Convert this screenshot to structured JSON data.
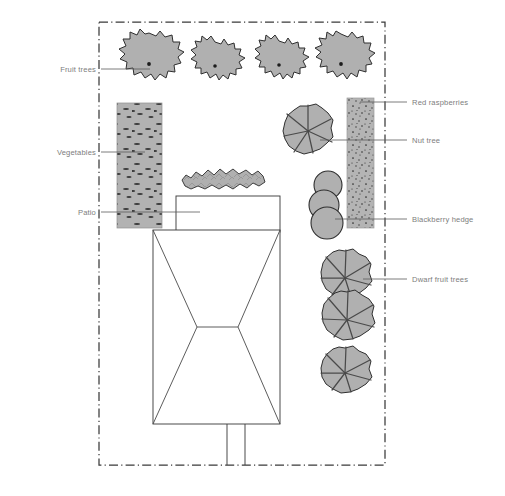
{
  "diagram": {
    "type": "garden-site-plan",
    "canvas": {
      "width": 505,
      "height": 496
    },
    "colors": {
      "background": "#ffffff",
      "boundary_line": "#3a3a3a",
      "plant_fill": "#b0b0b0",
      "plant_outline": "#2f2f2f",
      "bed_fill": "#b2b2b2",
      "structure_stroke": "#3f3f3f",
      "structure_fill": "#ffffff",
      "label_text": "#7d7d7d",
      "leader_line": "#5a5a5a"
    },
    "boundary": {
      "name": "property-boundary",
      "style": "dash-dot",
      "x": 99,
      "y": 22,
      "width": 286,
      "height": 443
    }
  },
  "labels": {
    "left": [
      {
        "id": "fruit-trees",
        "text": "Fruit trees",
        "text_x": 96,
        "text_y": 72,
        "leader_from_x": 101,
        "leader_to_x": 150,
        "leader_y": 69
      },
      {
        "id": "vegetables",
        "text": "Vegetables",
        "text_x": 96,
        "text_y": 155,
        "leader_from_x": 101,
        "leader_to_x": 145,
        "leader_y": 152
      },
      {
        "id": "patio",
        "text": "Patio",
        "text_x": 96,
        "text_y": 215,
        "leader_from_x": 101,
        "leader_to_x": 200,
        "leader_y": 212
      }
    ],
    "right": [
      {
        "id": "red-raspberries",
        "text": "Red raspberries",
        "text_x": 412,
        "text_y": 105,
        "leader_from_x": 360,
        "leader_to_x": 407,
        "leader_y": 102
      },
      {
        "id": "nut-tree",
        "text": "Nut tree",
        "text_x": 412,
        "text_y": 143,
        "leader_from_x": 320,
        "leader_to_x": 407,
        "leader_y": 140
      },
      {
        "id": "blackberry-hedge",
        "text": "Blackberry hedge",
        "text_x": 412,
        "text_y": 222,
        "leader_from_x": 335,
        "leader_to_x": 407,
        "leader_y": 219
      },
      {
        "id": "dwarf-fruit-trees",
        "text": "Dwarf fruit trees",
        "text_x": 412,
        "text_y": 282,
        "leader_from_x": 363,
        "leader_to_x": 407,
        "leader_y": 279
      }
    ]
  },
  "features": {
    "fruit_trees": {
      "name": "Fruit trees",
      "count": 4,
      "centers": [
        [
          149,
          64
        ],
        [
          215,
          66
        ],
        [
          279,
          65
        ],
        [
          341,
          64
        ]
      ],
      "radii": [
        31,
        26,
        26,
        28
      ]
    },
    "vegetable_bed": {
      "name": "Vegetables",
      "x": 117,
      "y": 103,
      "width": 45,
      "height": 125,
      "texture": "dashes"
    },
    "raspberry_strip": {
      "name": "Red raspberries",
      "x": 347,
      "y": 98,
      "width": 27,
      "height": 130,
      "texture": "stipple"
    },
    "nut_tree": {
      "name": "Nut tree",
      "center": [
        308,
        131
      ],
      "radius": 25,
      "lobes": 7
    },
    "blackberry_hedge": {
      "name": "Blackberry hedge",
      "circles": [
        {
          "cx": 328,
          "cy": 185,
          "r": 14
        },
        {
          "cx": 324,
          "cy": 205,
          "r": 15
        },
        {
          "cx": 327,
          "cy": 223,
          "r": 16
        }
      ]
    },
    "dwarf_fruit_trees": {
      "name": "Dwarf fruit trees",
      "count": 3,
      "centers": [
        [
          345,
          278
        ],
        [
          347,
          320
        ],
        [
          345,
          373
        ]
      ],
      "radii": [
        27,
        28,
        26
      ],
      "lobes": 7
    },
    "patio": {
      "name": "Patio",
      "x": 176,
      "y": 196,
      "width": 104,
      "height": 36
    },
    "house": {
      "name": "House roof plan",
      "x": 153,
      "y": 230,
      "width": 127,
      "height": 194,
      "ridge": {
        "x1": 197,
        "y1": 327,
        "x2": 238,
        "y2": 327
      }
    },
    "shrub": {
      "name": "Shrub bed",
      "cx": 222,
      "cy": 178,
      "rx": 43,
      "ry": 11
    },
    "path": {
      "name": "Front path",
      "x1": 227,
      "x2": 245,
      "y_top": 424,
      "y_bottom": 465
    }
  }
}
